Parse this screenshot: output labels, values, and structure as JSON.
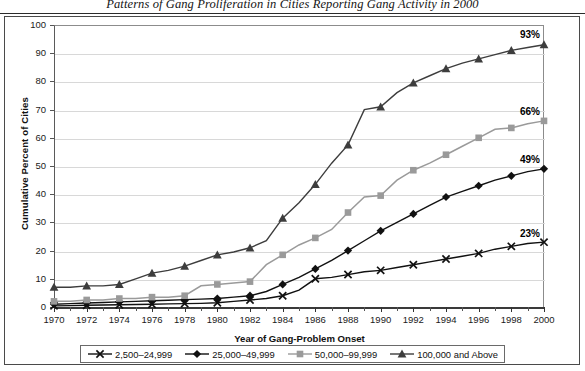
{
  "title": "Patterns of Gang Proliferation in Cities Reporting Gang Activity in 2000",
  "axis": {
    "xlabel": "Year of Gang-Problem Onset",
    "ylabel": "Cumulative Percent of Cities"
  },
  "yticks": [
    "0",
    "10",
    "20",
    "30",
    "40",
    "50",
    "60",
    "70",
    "80",
    "90",
    "100"
  ],
  "xticks": [
    "1970",
    "1972",
    "1974",
    "1976",
    "1978",
    "1980",
    "1982",
    "1984",
    "1986",
    "1988",
    "1990",
    "1992",
    "1994",
    "1996",
    "1998",
    "2000"
  ],
  "legend": {
    "items": [
      {
        "label": "2,500–24,999",
        "marker": "x-marker",
        "color": "#111111"
      },
      {
        "label": "25,000–49,999",
        "marker": "diamond-marker",
        "color": "#111111"
      },
      {
        "label": "50,000–99,999",
        "marker": "square-marker",
        "color": "#9a9a9a"
      },
      {
        "label": "100,000 and Above",
        "marker": "triangle-marker",
        "color": "#3d3d3d"
      }
    ]
  },
  "end_labels": [
    {
      "text": "93%",
      "series": "100,000 and Above"
    },
    {
      "text": "66%",
      "series": "50,000–99,999"
    },
    {
      "text": "49%",
      "series": "25,000–49,999"
    },
    {
      "text": "23%",
      "series": "2,500–24,999"
    }
  ],
  "chart_data": {
    "type": "line",
    "title": "Patterns of Gang Proliferation in Cities Reporting Gang Activity in 2000",
    "xlabel": "Year of Gang-Problem Onset",
    "ylabel": "Cumulative Percent of Cities",
    "xlim": [
      1970,
      2000
    ],
    "ylim": [
      0,
      100
    ],
    "grid": true,
    "legend_position": "bottom",
    "x": [
      1970,
      1971,
      1972,
      1973,
      1974,
      1975,
      1976,
      1977,
      1978,
      1979,
      1980,
      1981,
      1982,
      1983,
      1984,
      1985,
      1986,
      1987,
      1988,
      1989,
      1990,
      1991,
      1992,
      1993,
      1994,
      1995,
      1996,
      1997,
      1998,
      1999,
      2000
    ],
    "series": [
      {
        "name": "2,500–24,999",
        "marker": "x",
        "color": "#111111",
        "end_value": 23,
        "values": [
          0.4,
          0.5,
          0.6,
          0.7,
          0.8,
          0.9,
          1.0,
          1.1,
          1.2,
          1.3,
          1.5,
          2.0,
          2.5,
          3.0,
          4.0,
          6.0,
          10.0,
          10.5,
          11.5,
          12.5,
          13.0,
          14.0,
          15.0,
          16.0,
          17.0,
          18.0,
          19.0,
          20.5,
          21.5,
          22.5,
          23.0
        ]
      },
      {
        "name": "25,000–49,999",
        "marker": "diamond",
        "color": "#111111",
        "end_value": 49,
        "values": [
          1.0,
          1.2,
          1.4,
          1.6,
          1.8,
          2.0,
          2.2,
          2.4,
          2.6,
          2.8,
          3.0,
          3.5,
          4.0,
          5.5,
          8.0,
          10.5,
          13.5,
          16.5,
          20.0,
          23.5,
          27.0,
          30.0,
          33.0,
          36.0,
          39.0,
          41.0,
          43.0,
          45.0,
          46.5,
          48.0,
          49.0
        ]
      },
      {
        "name": "50,000–99,999",
        "marker": "square",
        "color": "#9a9a9a",
        "end_value": 66,
        "values": [
          2.0,
          2.0,
          2.5,
          2.5,
          3.0,
          3.0,
          3.5,
          3.5,
          4.0,
          7.5,
          8.0,
          8.5,
          9.0,
          15.0,
          18.5,
          22.0,
          24.5,
          27.5,
          33.5,
          39.0,
          39.5,
          45.0,
          48.5,
          51.0,
          54.0,
          57.0,
          60.0,
          63.0,
          63.5,
          65.0,
          66.0
        ]
      },
      {
        "name": "100,000 and Above",
        "marker": "triangle",
        "color": "#3d3d3d",
        "end_value": 93,
        "values": [
          7.0,
          7.0,
          7.5,
          7.5,
          8.0,
          10.0,
          12.0,
          13.0,
          14.5,
          16.5,
          18.5,
          19.5,
          21.0,
          23.5,
          31.5,
          37.0,
          43.5,
          51.0,
          57.5,
          70.0,
          71.0,
          76.0,
          79.5,
          82.0,
          84.5,
          86.5,
          88.0,
          89.5,
          91.0,
          92.0,
          93.0
        ]
      }
    ]
  }
}
